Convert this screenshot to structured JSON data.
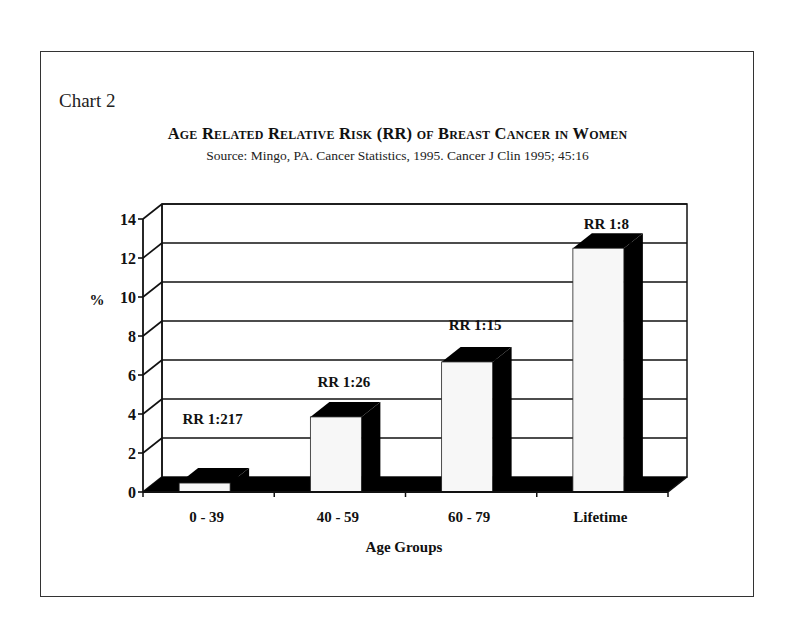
{
  "header": {
    "chart_label": "Chart 2",
    "title": "Age Related Relative Risk (RR) of Breast Cancer in Women",
    "source": "Source:   Mingo, PA.  Cancer Statistics, 1995.  Cancer J Clin 1995; 45:16"
  },
  "colors": {
    "bar_front": "#f7f7f7",
    "bar_side": "#000000",
    "floor": "#000000",
    "grid": "#111111",
    "frame": "#333333"
  },
  "chart_data": {
    "type": "bar",
    "style": "3d",
    "title": "Age Related Relative Risk (RR) of Breast Cancer in Women",
    "subtitle": "Source: Mingo, PA. Cancer Statistics, 1995. Cancer J Clin 1995; 45:16",
    "xlabel": "Age Groups",
    "ylabel": "%",
    "ylim": [
      0,
      14
    ],
    "yticks": [
      0,
      2,
      4,
      6,
      8,
      10,
      12,
      14
    ],
    "grid": true,
    "legend": null,
    "categories": [
      "0 - 39",
      "40 - 59",
      "60 - 79",
      "Lifetime"
    ],
    "values": [
      0.46,
      3.85,
      6.67,
      12.5
    ],
    "annotations": [
      "RR 1:217",
      "RR 1:26",
      "RR 1:15",
      "RR 1:8"
    ]
  }
}
